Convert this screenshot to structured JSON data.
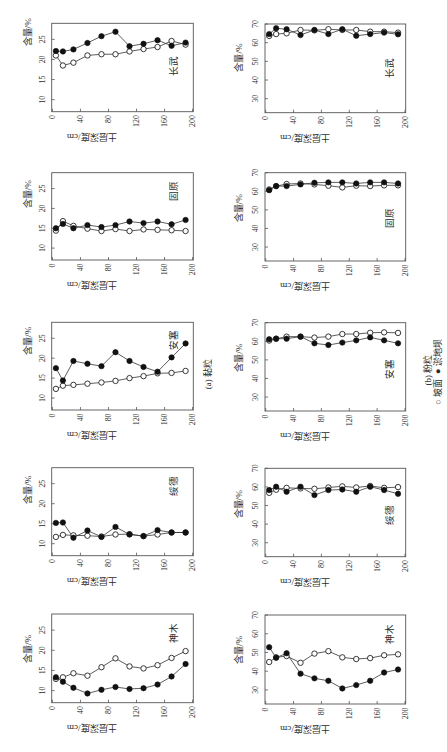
{
  "figure": {
    "layout_hint": "figure rotated 90° counter-clockwise; subplots stacked top-to-bottom, (a) left column, (b) right column",
    "legend": [
      {
        "symbol": "○",
        "label": "坡面",
        "marker": "open-circle"
      },
      {
        "symbol": "●",
        "label": "淤地坝",
        "marker": "filled-circle"
      }
    ],
    "colors": {
      "background": "#ffffff",
      "frame": "#555555",
      "line": "#333333",
      "open_marker_fill": "#ffffff",
      "open_marker_stroke": "#222222",
      "filled_marker": "#111111"
    }
  },
  "chart_data": [
    {
      "type": "line",
      "title": "(a) 黏粒",
      "xlabel": "土层深度/cm",
      "ylabel": "含量/%",
      "xlim": [
        -1,
        201
      ],
      "ylim": [
        7,
        29
      ],
      "xticks": [
        0,
        40,
        80,
        120,
        160,
        200
      ],
      "yticks": [
        10,
        15,
        20,
        25
      ],
      "grid": false,
      "legend_position": "bottom (shared)",
      "x": [
        5,
        15,
        30,
        50,
        70,
        90,
        110,
        130,
        150,
        170,
        190
      ],
      "panels": [
        {
          "site": "长武",
          "series": [
            {
              "name": "坡面",
              "marker": "open-circle",
              "values": [
                21.0,
                18.5,
                19.2,
                21.0,
                21.3,
                21.3,
                22.0,
                22.6,
                23.1,
                24.6,
                23.7
              ]
            },
            {
              "name": "淤地坝",
              "marker": "filled-circle",
              "values": [
                22.1,
                22.0,
                22.5,
                24.1,
                25.8,
                26.9,
                23.3,
                23.9,
                24.8,
                23.4,
                24.2
              ]
            }
          ]
        },
        {
          "site": "固原",
          "series": [
            {
              "name": "坡面",
              "marker": "open-circle",
              "values": [
                14.4,
                16.8,
                15.6,
                14.9,
                14.3,
                14.8,
                14.3,
                14.7,
                14.6,
                14.5,
                14.3
              ]
            },
            {
              "name": "淤地坝",
              "marker": "filled-circle",
              "values": [
                15.0,
                16.1,
                15.0,
                15.8,
                15.3,
                15.8,
                16.7,
                16.3,
                16.7,
                16.0,
                17.1
              ]
            }
          ]
        },
        {
          "site": "安塞",
          "series": [
            {
              "name": "坡面",
              "marker": "open-circle",
              "values": [
                12.3,
                13.1,
                13.3,
                13.6,
                13.9,
                14.3,
                15.0,
                15.5,
                16.2,
                16.3,
                16.8
              ]
            },
            {
              "name": "淤地坝",
              "marker": "filled-circle",
              "values": [
                17.5,
                14.4,
                19.3,
                18.6,
                18.0,
                21.5,
                19.3,
                17.8,
                16.6,
                20.2,
                23.7
              ]
            }
          ]
        },
        {
          "site": "绥德",
          "series": [
            {
              "name": "坡面",
              "marker": "open-circle",
              "values": [
                11.7,
                12.2,
                12.1,
                12.0,
                11.8,
                12.3,
                12.4,
                11.9,
                12.3,
                12.8,
                12.8
              ]
            },
            {
              "name": "淤地坝",
              "marker": "filled-circle",
              "values": [
                15.2,
                15.3,
                11.5,
                13.3,
                11.7,
                14.2,
                12.3,
                11.9,
                13.4,
                12.8,
                12.8
              ]
            }
          ]
        },
        {
          "site": "神木",
          "series": [
            {
              "name": "坡面",
              "marker": "open-circle",
              "values": [
                12.9,
                13.3,
                14.3,
                13.7,
                15.8,
                18.0,
                16.0,
                15.5,
                16.3,
                18.1,
                19.8
              ]
            },
            {
              "name": "淤地坝",
              "marker": "filled-circle",
              "values": [
                13.3,
                12.2,
                10.7,
                9.3,
                10.2,
                10.9,
                10.4,
                10.6,
                11.5,
                13.5,
                16.6
              ]
            }
          ]
        }
      ]
    },
    {
      "type": "line",
      "title": "(b) 粉粒",
      "xlabel": "土层深度/cm",
      "ylabel": "含量/%",
      "xlim": [
        -1,
        201
      ],
      "ylim": [
        22.5,
        70
      ],
      "xticks": [
        0,
        40,
        80,
        120,
        160,
        200
      ],
      "yticks": [
        30,
        40,
        50,
        60,
        70
      ],
      "grid": false,
      "legend_position": "bottom (shared)",
      "x": [
        5,
        15,
        30,
        50,
        70,
        90,
        110,
        130,
        150,
        170,
        190
      ],
      "panels": [
        {
          "site": "长武",
          "series": [
            {
              "name": "坡面",
              "marker": "open-circle",
              "values": [
                63.6,
                64.6,
                65.0,
                66.8,
                66.6,
                67.2,
                66.8,
                66.8,
                65.9,
                65.9,
                65.4
              ]
            },
            {
              "name": "淤地坝",
              "marker": "filled-circle",
              "values": [
                64.6,
                67.7,
                67.2,
                64.1,
                66.8,
                64.6,
                67.2,
                63.7,
                64.6,
                65.4,
                64.5
              ]
            }
          ]
        },
        {
          "site": "固原",
          "series": [
            {
              "name": "坡面",
              "marker": "open-circle",
              "values": [
                61.0,
                62.8,
                63.9,
                64.2,
                63.7,
                63.0,
                62.1,
                63.0,
                62.8,
                63.2,
                63.2
              ]
            },
            {
              "name": "淤地坝",
              "marker": "filled-circle",
              "values": [
                60.6,
                62.8,
                62.8,
                63.7,
                64.6,
                64.8,
                64.8,
                64.2,
                64.8,
                64.8,
                64.2
              ]
            }
          ]
        },
        {
          "site": "安塞",
          "series": [
            {
              "name": "坡面",
              "marker": "open-circle",
              "values": [
                60.4,
                61.4,
                62.5,
                62.5,
                62.0,
                62.5,
                63.9,
                63.9,
                64.6,
                64.8,
                64.5
              ]
            },
            {
              "name": "淤地坝",
              "marker": "filled-circle",
              "values": [
                61.1,
                61.4,
                61.4,
                62.5,
                58.9,
                58.0,
                59.3,
                60.5,
                62.1,
                60.5,
                58.9
              ]
            }
          ]
        },
        {
          "site": "绥德",
          "series": [
            {
              "name": "坡面",
              "marker": "open-circle",
              "values": [
                56.8,
                58.5,
                59.5,
                59.2,
                59.0,
                59.7,
                60.3,
                59.7,
                60.5,
                59.5,
                59.9
              ]
            },
            {
              "name": "淤地坝",
              "marker": "filled-circle",
              "values": [
                58.3,
                60.1,
                57.4,
                60.1,
                55.6,
                58.3,
                58.6,
                57.4,
                60.1,
                58.3,
                56.3
              ]
            }
          ]
        },
        {
          "site": "神木",
          "series": [
            {
              "name": "坡面",
              "marker": "open-circle",
              "values": [
                44.9,
                47.4,
                48.1,
                44.5,
                49.4,
                50.7,
                47.4,
                46.5,
                47.0,
                48.5,
                49.0
              ]
            },
            {
              "name": "淤地坝",
              "marker": "filled-circle",
              "values": [
                52.8,
                47.2,
                49.6,
                38.7,
                36.2,
                34.9,
                30.8,
                32.6,
                34.9,
                39.3,
                40.9
              ]
            }
          ]
        }
      ]
    }
  ]
}
